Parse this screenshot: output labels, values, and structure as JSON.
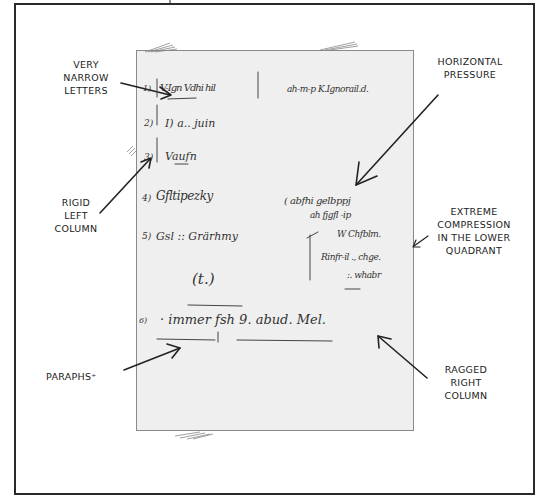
{
  "diagram": {
    "title": "",
    "frame_color": "#2a2a2a",
    "paper_color": "#efefef",
    "annotations": [
      {
        "id": "very-narrow-letters",
        "text": "VERY\nNARROW\nLETTERS"
      },
      {
        "id": "horizontal-pressure",
        "text": "HORIZONTAL\nPRESSURE"
      },
      {
        "id": "rigid-left-column",
        "text": "RIGID\nLEFT\nCOLUMN"
      },
      {
        "id": "extreme-compression",
        "text": "EXTREME\nCOMPRESSION\nIN THE LOWER\nQUADRANT"
      },
      {
        "id": "paraphs",
        "text": "PARAPHS⁺"
      },
      {
        "id": "ragged-right-column",
        "text": "RAGGED\nRIGHT\nCOLUMN"
      }
    ],
    "document_lines": [
      {
        "num": "1)",
        "left": "V-Ign Vdhi hil",
        "right": "ah-m-p K.Ignorail.d."
      },
      {
        "num": "2)",
        "left": "I) a.. juin"
      },
      {
        "num": "3)",
        "left": "Vaufn"
      },
      {
        "num": "4)",
        "left": "Gfltipezky",
        "right": "( abfhi gelbppj"
      },
      {
        "num": "5)",
        "left": "Gsl :: Grärhmy",
        "right": "ah fjgfl -ip"
      },
      {
        "right": "W Chfblm."
      },
      {
        "right": "Rinfr-il ., chge."
      },
      {
        "right": ":. whabr"
      },
      {
        "center": "(t.)"
      },
      {
        "num": "6)",
        "left": "· immer fsh  9. abud. Mel."
      }
    ]
  }
}
